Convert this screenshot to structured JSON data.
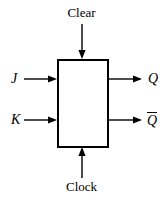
{
  "figure": {
    "width": 167,
    "height": 202,
    "background_color": "#ffffff",
    "line_color": "#000000",
    "box": {
      "name": "flip-flop-body",
      "x": 57,
      "y": 59,
      "width": 51,
      "height": 88,
      "stroke_width": 2,
      "fill": "#ffffff"
    },
    "inputs": [
      {
        "id": "clear",
        "label": "Clear",
        "style": "upright",
        "side": "top",
        "arrow_direction": "down",
        "line_x": 82,
        "line_from_y": 24,
        "line_to_y": 59
      },
      {
        "id": "j",
        "label": "J",
        "style": "italic",
        "side": "left",
        "arrow_direction": "right",
        "line_y": 79,
        "line_from_x": 24,
        "line_to_x": 57
      },
      {
        "id": "k",
        "label": "K",
        "style": "italic",
        "side": "left",
        "arrow_direction": "right",
        "line_y": 120,
        "line_from_x": 24,
        "line_to_x": 57
      },
      {
        "id": "clock",
        "label": "Clock",
        "style": "upright",
        "side": "bottom",
        "arrow_direction": "up",
        "line_x": 82,
        "line_from_y": 178,
        "line_to_y": 147
      }
    ],
    "outputs": [
      {
        "id": "q",
        "label": "Q",
        "style": "italic",
        "overline": false,
        "side": "right",
        "arrow_direction": "right",
        "line_y": 79,
        "line_from_x": 108,
        "line_to_x": 142
      },
      {
        "id": "q-bar",
        "label": "Q",
        "style": "italic",
        "overline": true,
        "side": "right",
        "arrow_direction": "right",
        "line_y": 120,
        "line_from_x": 108,
        "line_to_x": 142
      }
    ]
  }
}
